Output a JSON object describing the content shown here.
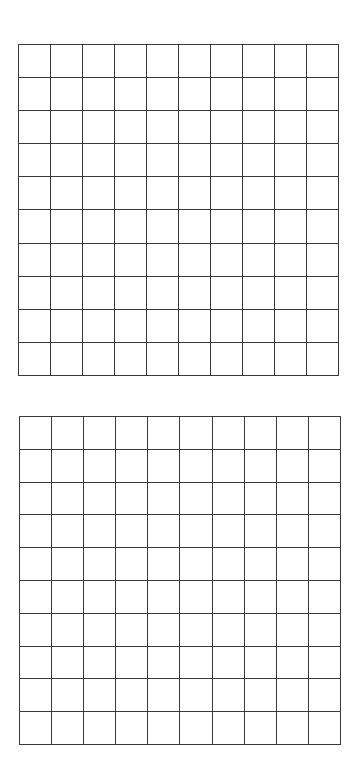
{
  "grids": [
    {
      "id": "grid-top",
      "rows": 10,
      "cols": 10,
      "line_color": "#3a3a3a"
    },
    {
      "id": "grid-bottom",
      "rows": 10,
      "cols": 10,
      "line_color": "#3a3a3a"
    }
  ]
}
